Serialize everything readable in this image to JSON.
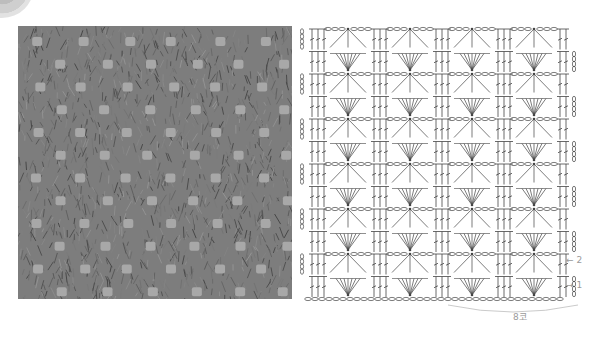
{
  "figure": {
    "photo_alt": "Crocheted swatch photograph (gray yarn, lace pattern)",
    "chart": {
      "rows": 12,
      "repeats": 4,
      "row_labels": [
        {
          "text": "2",
          "arrow": "←"
        },
        {
          "text": "1",
          "arrow": "→"
        }
      ],
      "repeat_label": "8코"
    }
  },
  "colors": {
    "yarn": "#7d7d7d",
    "hole": "#a8a8a8",
    "line": "#444444",
    "label": "#9a9a9a"
  }
}
